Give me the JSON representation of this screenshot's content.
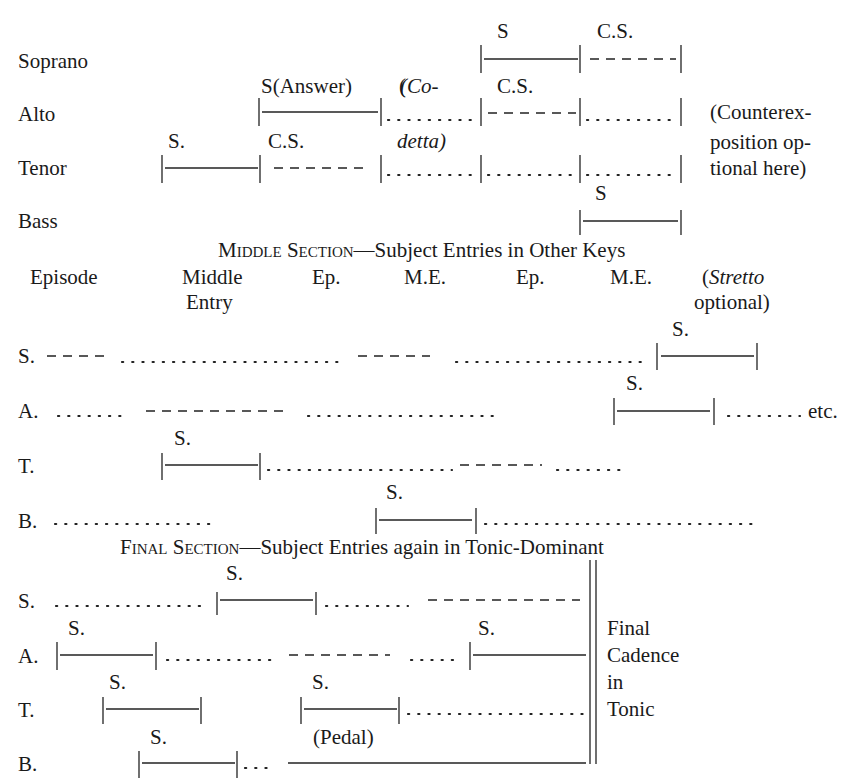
{
  "exposition": {
    "voices": [
      "Soprano",
      "Alto",
      "Tenor",
      "Bass"
    ],
    "labels": {
      "soprano_s": "S",
      "soprano_cs": "C.S.",
      "alto_answer": "S(Answer)",
      "alto_codetta_open": "(Co-",
      "alto_codetta_close": "detta)",
      "alto_cs": "C.S.",
      "tenor_s": "S.",
      "tenor_cs": "C.S.",
      "bass_s": "S"
    },
    "note": [
      "(Counterex-",
      "position op-",
      "tional here)"
    ]
  },
  "middle": {
    "heading_sc": "Middle Section",
    "heading_rest": "—Subject Entries in Other Keys",
    "columns": [
      "Episode",
      "Middle",
      "Ep.",
      "M.E.",
      "Ep.",
      "M.E."
    ],
    "column_sub": "Entry",
    "stretto_open": "(",
    "stretto_word": "Stretto",
    "stretto_line2": "optional)",
    "voices": [
      "S.",
      "A.",
      "T.",
      "B."
    ],
    "entry_label": "S.",
    "etc": "etc."
  },
  "final": {
    "heading_sc": "Final Section",
    "heading_rest": "—Subject Entries again in Tonic-Dominant",
    "voices": [
      "S.",
      "A.",
      "T.",
      "B."
    ],
    "entry_label": "S.",
    "pedal": "(Pedal)",
    "cadence": [
      "Final",
      "Cadence",
      "in",
      "Tonic"
    ]
  }
}
